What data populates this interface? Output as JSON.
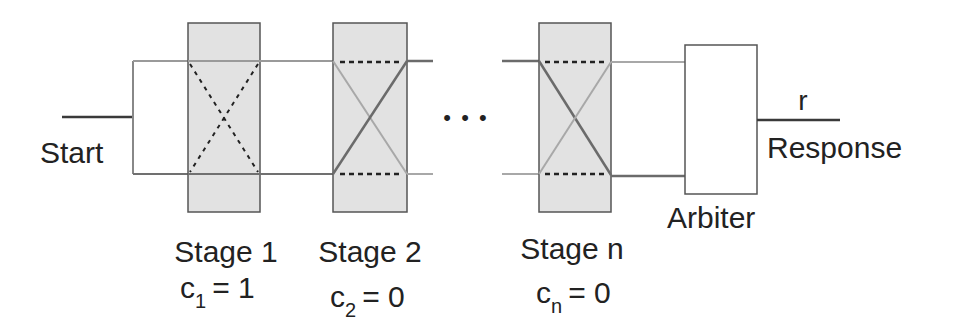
{
  "diagram": {
    "input_label": "Start",
    "ellipsis": "• • •",
    "arbiter_label": "Arbiter",
    "output_symbol": "r",
    "output_label": "Response",
    "stages": [
      {
        "label": "Stage 1",
        "challenge_var": "c",
        "challenge_sub": "1",
        "challenge_eq": "= 1",
        "mode": "crossed"
      },
      {
        "label": "Stage 2",
        "challenge_var": "c",
        "challenge_sub": "2",
        "challenge_eq": "= 0",
        "mode": "straight"
      },
      {
        "label": "Stage n",
        "challenge_var": "c",
        "challenge_sub": "n",
        "challenge_eq": "= 0",
        "mode": "straight"
      }
    ],
    "colors": {
      "stage_fill": "#e2e2e2",
      "stage_border": "#555555",
      "path_top": "#9a9a9a",
      "path_bottom": "#707070",
      "active_dark": "#6b6b6b",
      "active_light": "#a8a8a8",
      "dashed": "#222222",
      "text": "#222222"
    }
  }
}
